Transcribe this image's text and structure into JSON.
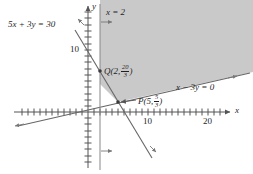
{
  "figure": {
    "kind": "linear-programming-feasible-region",
    "background": "#ffffff",
    "shade_color": "#c9c9c9",
    "line_color": "#555555",
    "axis_color": "#555555",
    "text_color": "#1f1f1f"
  },
  "axes": {
    "x_label": "x",
    "y_label": "y",
    "x_ticks": [
      {
        "value": 10,
        "label": "10"
      },
      {
        "value": 20,
        "label": "20"
      }
    ],
    "y_ticks": [
      {
        "value": 10,
        "label": "10"
      }
    ],
    "x_range": [
      -6,
      23
    ],
    "y_range": [
      -10,
      16
    ],
    "tick_spacing": 1,
    "origin_px": {
      "x": 88,
      "y": 112
    },
    "scale_px_per_unit": {
      "x": 6.0,
      "y": 6.2
    }
  },
  "lines": [
    {
      "name": "line-5x-3y-30",
      "label": "5x + 3y = 30",
      "equation": "5x + 3y = 30"
    },
    {
      "name": "line-x-3y-0",
      "label": "x − 3y = 0",
      "equation": "x - 3y = 0"
    },
    {
      "name": "line-x-2",
      "label": "x = 2",
      "equation": "x = 2"
    }
  ],
  "labels": {
    "line1": "5x + 3y = 30",
    "line2": "x − 3y = 0",
    "line3": "x = 2",
    "axis_x": "x",
    "axis_y": "y"
  },
  "points": [
    {
      "name": "point-Q",
      "letter": "Q",
      "x": "2",
      "y_num": "20",
      "y_den": "3",
      "label": "Q(2, 20/3)",
      "px": {
        "x": 100,
        "y": 71
      }
    },
    {
      "name": "point-P",
      "letter": "P",
      "x": "5",
      "y_num": "5",
      "y_den": "3",
      "label": "P(5, 5/3)",
      "px": {
        "x": 118,
        "y": 102
      }
    }
  ],
  "region": {
    "name": "feasible-region",
    "description": "shaded region bounded on the left by x = 2 and below by x - 3y = 0",
    "vertices_px": "100,0 253,0 253,72 118,102 100,84"
  }
}
